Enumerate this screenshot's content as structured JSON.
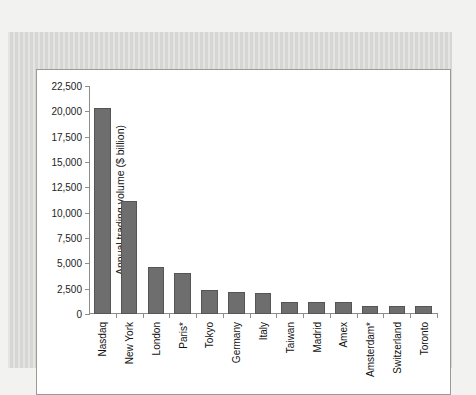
{
  "page": {
    "bleed_top": "",
    "bleed_bottom": "",
    "plate_ghost": ""
  },
  "chart_data": {
    "type": "bar",
    "title": "",
    "xlabel": "",
    "ylabel": "Annual trading volume ($ billion)",
    "ylim": [
      0,
      22500
    ],
    "ytick_labels": [
      "22,500",
      "20,000",
      "17,500",
      "15,000",
      "12,500",
      "10,000",
      "7,500",
      "5,000",
      "2,500",
      "0"
    ],
    "yticks": [
      22500,
      20000,
      17500,
      15000,
      12500,
      10000,
      7500,
      5000,
      2500,
      0
    ],
    "grid": false,
    "legend": false,
    "bar_color": "#6e6e6e",
    "categories": [
      "Nasdaq",
      "New York",
      "London",
      "Paris*",
      "Tokyo",
      "Germany",
      "Italy",
      "Taiwan",
      "Madrid",
      "Amex",
      "Amsterdam*",
      "Switzerland",
      "Toronto"
    ],
    "values": [
      20300,
      11200,
      4650,
      4050,
      2400,
      2200,
      2100,
      1150,
      1150,
      1150,
      800,
      800,
      750
    ]
  }
}
